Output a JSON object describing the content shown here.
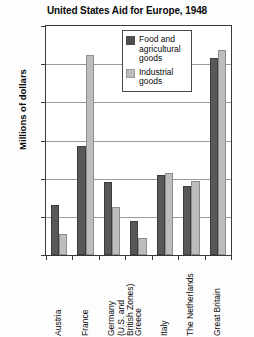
{
  "chart_data": {
    "type": "bar",
    "title": "United States Aid for Europe, 1948",
    "xlabel": "",
    "ylabel": "Millions of dollars",
    "ylim": [
      0,
      600
    ],
    "ytick_values": [
      600,
      500,
      400,
      300,
      200,
      100,
      0
    ],
    "ytick_labels": [
      "600",
      "500",
      "400",
      "300",
      "200",
      "100",
      "0"
    ],
    "grid": true,
    "legend_position": "top-center",
    "categories": [
      "Austria",
      "France",
      "Germany\n(U.S. and\nBritish Zones)",
      "Greece",
      "Italy",
      "The Netherlands",
      "Great Britain"
    ],
    "series": [
      {
        "name": "Food and agricultural goods",
        "color": "#585858",
        "values": [
          130,
          285,
          190,
          90,
          210,
          180,
          517
        ]
      },
      {
        "name": "Industrial goods",
        "color": "#bdbdbd",
        "values": [
          55,
          525,
          125,
          45,
          215,
          195,
          538
        ]
      }
    ]
  },
  "legend": {
    "entries": [
      {
        "label": "Food and agricultural goods"
      },
      {
        "label": "Industrial goods"
      }
    ]
  }
}
